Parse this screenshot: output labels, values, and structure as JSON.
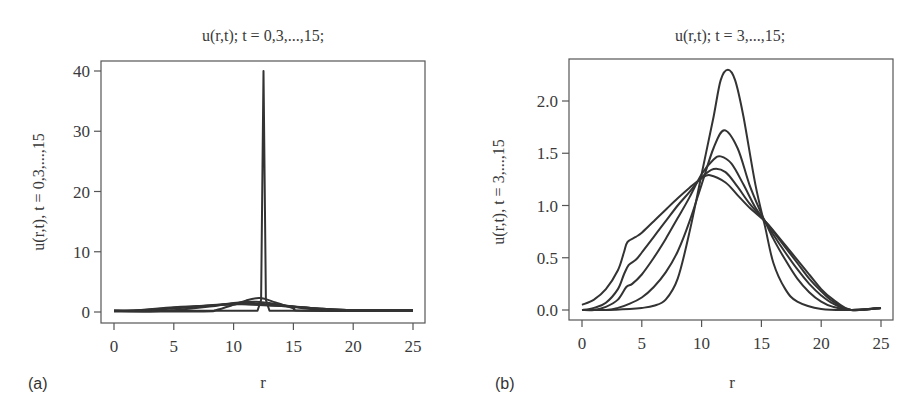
{
  "figure": {
    "panels": [
      {
        "letter": "(a)",
        "title": "u(r,t); t = 0,3,...,15;",
        "xlabel": "r",
        "ylabel": "u(r,t), t = 0,3,...,15"
      },
      {
        "letter": "(b)",
        "title": "u(r,t); t = 3,...,15;",
        "xlabel": "r",
        "ylabel": "u(r,t), t = 3,...,15"
      }
    ]
  },
  "chart_data": [
    {
      "type": "line",
      "title": "u(r,t); t = 0,3,...,15;",
      "xlabel": "r",
      "ylabel": "u(r,t), t = 0,3,...,15",
      "xlim": [
        0,
        25
      ],
      "ylim": [
        0,
        40
      ],
      "xticks": [
        0,
        5,
        10,
        15,
        20,
        25
      ],
      "yticks": [
        0,
        10,
        20,
        30,
        40
      ],
      "grid": false,
      "legend": null,
      "line_color": "#333333",
      "series": [
        {
          "name": "t = 0",
          "x": [
            0,
            12.0,
            12.3,
            12.5,
            12.7,
            13.0,
            25
          ],
          "y": [
            0.2,
            0.2,
            2,
            40,
            2,
            0.2,
            0.2
          ]
        },
        {
          "name": "t = 3",
          "x": [
            0,
            7.5,
            8.5,
            10,
            11,
            12.2,
            13.5,
            15,
            16,
            25
          ],
          "y": [
            0.1,
            0.1,
            0.3,
            1.2,
            1.9,
            2.3,
            1.6,
            0.6,
            0.2,
            0.2
          ]
        },
        {
          "name": "t = 6",
          "x": [
            0,
            3,
            5,
            8,
            10,
            11.9,
            14,
            16,
            18,
            25
          ],
          "y": [
            0.2,
            0.1,
            0.3,
            0.9,
            1.5,
            1.7,
            1.2,
            0.6,
            0.3,
            0.3
          ]
        },
        {
          "name": "t = 9",
          "x": [
            0,
            2,
            5,
            8,
            10,
            11.6,
            14,
            17,
            20,
            25
          ],
          "y": [
            0.2,
            0.2,
            0.6,
            1.1,
            1.4,
            1.47,
            1.1,
            0.6,
            0.3,
            0.3
          ]
        },
        {
          "name": "t = 12",
          "x": [
            0,
            2,
            5,
            8,
            10,
            11.0,
            14,
            17,
            20,
            25
          ],
          "y": [
            0.2,
            0.3,
            0.7,
            1.1,
            1.3,
            1.35,
            1.0,
            0.6,
            0.3,
            0.3
          ]
        },
        {
          "name": "t = 15",
          "x": [
            0,
            2,
            5,
            8,
            10,
            10.7,
            14,
            17,
            20,
            25
          ],
          "y": [
            0.2,
            0.3,
            0.8,
            1.1,
            1.27,
            1.29,
            1.0,
            0.6,
            0.3,
            0.3
          ]
        }
      ],
      "annotations": [
        "Sharp spike at r ≈ 12.5 reaching u = 40 (initial condition t = 0)"
      ]
    },
    {
      "type": "line",
      "title": "u(r,t); t = 3,...,15;",
      "xlabel": "r",
      "ylabel": "u(r,t), t = 3,...,15",
      "xlim": [
        0,
        25
      ],
      "ylim": [
        0,
        2.3
      ],
      "xticks": [
        0,
        5,
        10,
        15,
        20,
        25
      ],
      "yticks": [
        0.0,
        0.5,
        1.0,
        1.5,
        2.0
      ],
      "ytick_labels": [
        "0.0",
        "0.5",
        "1.0",
        "1.5",
        "2.0"
      ],
      "grid": false,
      "legend": null,
      "line_color": "#333333",
      "series": [
        {
          "name": "t = 3",
          "x": [
            0,
            2,
            4,
            5,
            6,
            7,
            8,
            9,
            10,
            11,
            11.6,
            12.2,
            12.8,
            13.5,
            14.5,
            15.3,
            16,
            17,
            18,
            20,
            22.5,
            25
          ],
          "y": [
            0.0,
            0.0,
            0.01,
            0.02,
            0.04,
            0.1,
            0.3,
            0.75,
            1.3,
            1.85,
            2.2,
            2.3,
            2.2,
            1.85,
            1.2,
            0.8,
            0.45,
            0.2,
            0.08,
            0.01,
            0.0,
            0.02
          ]
        },
        {
          "name": "t = 6",
          "x": [
            0,
            2,
            3,
            4,
            5,
            6,
            7,
            8,
            9,
            10,
            11,
            11.9,
            13,
            14,
            15,
            15.3,
            16,
            17,
            18,
            19,
            20,
            21,
            22.5,
            25
          ],
          "y": [
            0.0,
            0.0,
            0.02,
            0.06,
            0.12,
            0.22,
            0.36,
            0.56,
            0.85,
            1.2,
            1.55,
            1.72,
            1.55,
            1.2,
            0.92,
            0.85,
            0.68,
            0.48,
            0.3,
            0.17,
            0.08,
            0.03,
            0.0,
            0.02
          ]
        },
        {
          "name": "t = 9",
          "x": [
            0,
            1,
            2,
            3,
            3.7,
            4.2,
            5,
            6,
            7,
            8,
            9,
            10,
            11,
            11.6,
            12.5,
            13.5,
            14.5,
            15.3,
            16,
            17,
            18,
            19,
            20,
            21,
            22.5,
            25
          ],
          "y": [
            0.0,
            0.0,
            0.03,
            0.1,
            0.22,
            0.25,
            0.34,
            0.5,
            0.68,
            0.88,
            1.08,
            1.3,
            1.44,
            1.47,
            1.4,
            1.2,
            0.98,
            0.85,
            0.72,
            0.55,
            0.39,
            0.25,
            0.14,
            0.06,
            0.0,
            0.02
          ]
        },
        {
          "name": "t = 12",
          "x": [
            0,
            1,
            2,
            3,
            3.5,
            3.9,
            4.5,
            5,
            6,
            7,
            8,
            9,
            10,
            11,
            12,
            13,
            14,
            15.3,
            16,
            17,
            18,
            19,
            20,
            21,
            22.5,
            25
          ],
          "y": [
            0.0,
            0.02,
            0.07,
            0.2,
            0.34,
            0.43,
            0.48,
            0.55,
            0.7,
            0.85,
            1.0,
            1.13,
            1.27,
            1.35,
            1.32,
            1.18,
            1.02,
            0.85,
            0.75,
            0.6,
            0.45,
            0.3,
            0.18,
            0.08,
            0.0,
            0.02
          ]
        },
        {
          "name": "t = 15",
          "x": [
            0,
            1,
            2,
            3,
            3.5,
            3.8,
            4.5,
            5,
            6,
            7,
            8,
            9,
            10,
            10.7,
            12,
            13,
            14,
            15.3,
            16,
            17,
            18,
            19,
            20,
            21,
            22.5,
            25
          ],
          "y": [
            0.05,
            0.1,
            0.2,
            0.38,
            0.55,
            0.65,
            0.7,
            0.74,
            0.85,
            0.96,
            1.07,
            1.17,
            1.26,
            1.29,
            1.22,
            1.1,
            0.98,
            0.85,
            0.76,
            0.62,
            0.48,
            0.34,
            0.2,
            0.1,
            0.0,
            0.02
          ]
        }
      ]
    }
  ]
}
